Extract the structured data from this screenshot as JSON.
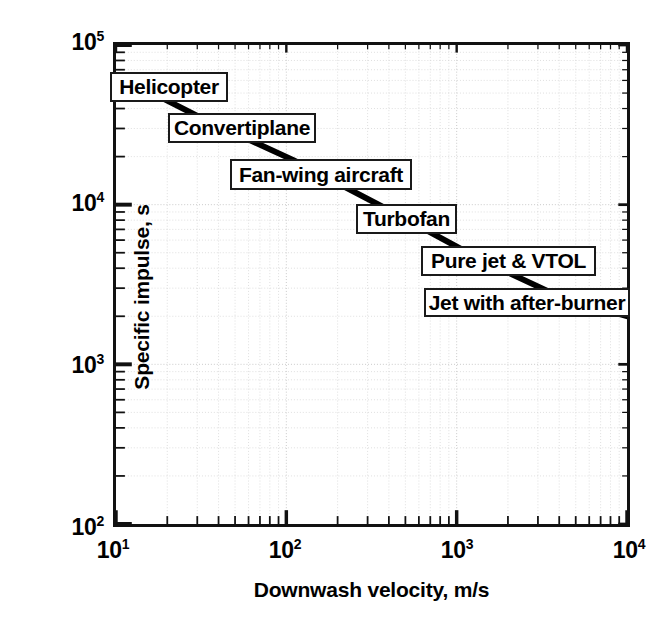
{
  "figure": {
    "background_color": "#ffffff",
    "frame_color": "#111111",
    "grid_color": "#c9c9c9",
    "series_color": "#000000"
  },
  "chart_data": {
    "type": "line",
    "title": "",
    "xlabel": "Downwash velocity, m/s",
    "ylabel": "Specific impulse, s",
    "xscale": "log",
    "yscale": "log",
    "xlim": [
      10,
      10000
    ],
    "ylim": [
      100,
      100000
    ],
    "grid": true,
    "legend": "none",
    "xticks": [
      {
        "value": 10,
        "label": "10",
        "exponent": "1"
      },
      {
        "value": 100,
        "label": "10",
        "exponent": "2"
      },
      {
        "value": 1000,
        "label": "10",
        "exponent": "3"
      },
      {
        "value": 10000,
        "label": "10",
        "exponent": "4"
      }
    ],
    "yticks": [
      {
        "value": 100000,
        "label": "10",
        "exponent": "5"
      },
      {
        "value": 10000,
        "label": "10",
        "exponent": "4"
      },
      {
        "value": 1000,
        "label": "10",
        "exponent": "3"
      },
      {
        "value": 100,
        "label": "10",
        "exponent": "2"
      }
    ],
    "series": [
      {
        "name": "Specific impulse trend",
        "x": [
          11,
          30,
          110,
          420,
          1400,
          4200,
          10000
        ],
        "y": [
          62000,
          36000,
          19000,
          9000,
          4500,
          2600,
          2000
        ]
      }
    ],
    "annotations": [
      {
        "label": "Helicopter",
        "x": 13,
        "y": 55000,
        "box": {
          "left": 110,
          "top": 72,
          "width": 118,
          "height": 30
        }
      },
      {
        "label": "Convertiplane",
        "x": 33,
        "y": 33000,
        "box": {
          "left": 168,
          "top": 113,
          "width": 148,
          "height": 30
        }
      },
      {
        "label": "Fan-wing aircraft",
        "x": 110,
        "y": 19000,
        "box": {
          "left": 230,
          "top": 159,
          "width": 182,
          "height": 31
        }
      },
      {
        "label": "Turbofan",
        "x": 420,
        "y": 9000,
        "box": {
          "left": 356,
          "top": 204,
          "width": 101,
          "height": 30
        }
      },
      {
        "label": "Pure jet & VTOL",
        "x": 1500,
        "y": 4400,
        "box": {
          "left": 421,
          "top": 246,
          "width": 175,
          "height": 30
        }
      },
      {
        "label": "Jet with after-burner",
        "x": 5000,
        "y": 2400,
        "box": {
          "left": 424,
          "top": 288,
          "width": 206,
          "height": 29
        }
      }
    ],
    "connectors": [
      {
        "from": [
          160,
          100
        ],
        "to": [
          215,
          122
        ]
      },
      {
        "from": [
          248,
          142
        ],
        "to": [
          310,
          168
        ]
      },
      {
        "from": [
          330,
          190
        ],
        "to": [
          400,
          214
        ]
      },
      {
        "from": [
          410,
          233
        ],
        "to": [
          455,
          254
        ]
      },
      {
        "from": [
          487,
          275
        ],
        "to": [
          540,
          297
        ]
      }
    ]
  }
}
